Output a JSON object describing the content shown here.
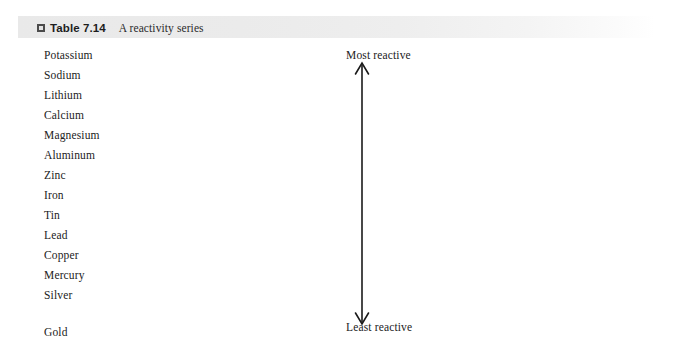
{
  "caption": {
    "icon": "table-marker-icon",
    "number": "Table 7.14",
    "title": "A reactivity series"
  },
  "series": {
    "items": [
      {
        "name": "Potassium"
      },
      {
        "name": "Sodium"
      },
      {
        "name": "Lithium"
      },
      {
        "name": "Calcium"
      },
      {
        "name": "Magnesium"
      },
      {
        "name": "Aluminum"
      },
      {
        "name": "Zinc"
      },
      {
        "name": "Iron"
      },
      {
        "name": "Tin"
      },
      {
        "name": "Lead"
      },
      {
        "name": "Copper"
      },
      {
        "name": "Mercury"
      },
      {
        "name": "Silver"
      },
      {
        "name": "Gold"
      }
    ]
  },
  "scale": {
    "top_label": "Most reactive",
    "bottom_label": "Least reactive",
    "arrow": "double-headed-vertical-arrow-icon"
  },
  "colors": {
    "band_start": "#e9e9e9",
    "band_end": "#ffffff",
    "text": "#222222",
    "caption_number_text": "#1d1d1d",
    "arrow": "#1a1a1a",
    "icon_fill": "#4b4b4b"
  }
}
